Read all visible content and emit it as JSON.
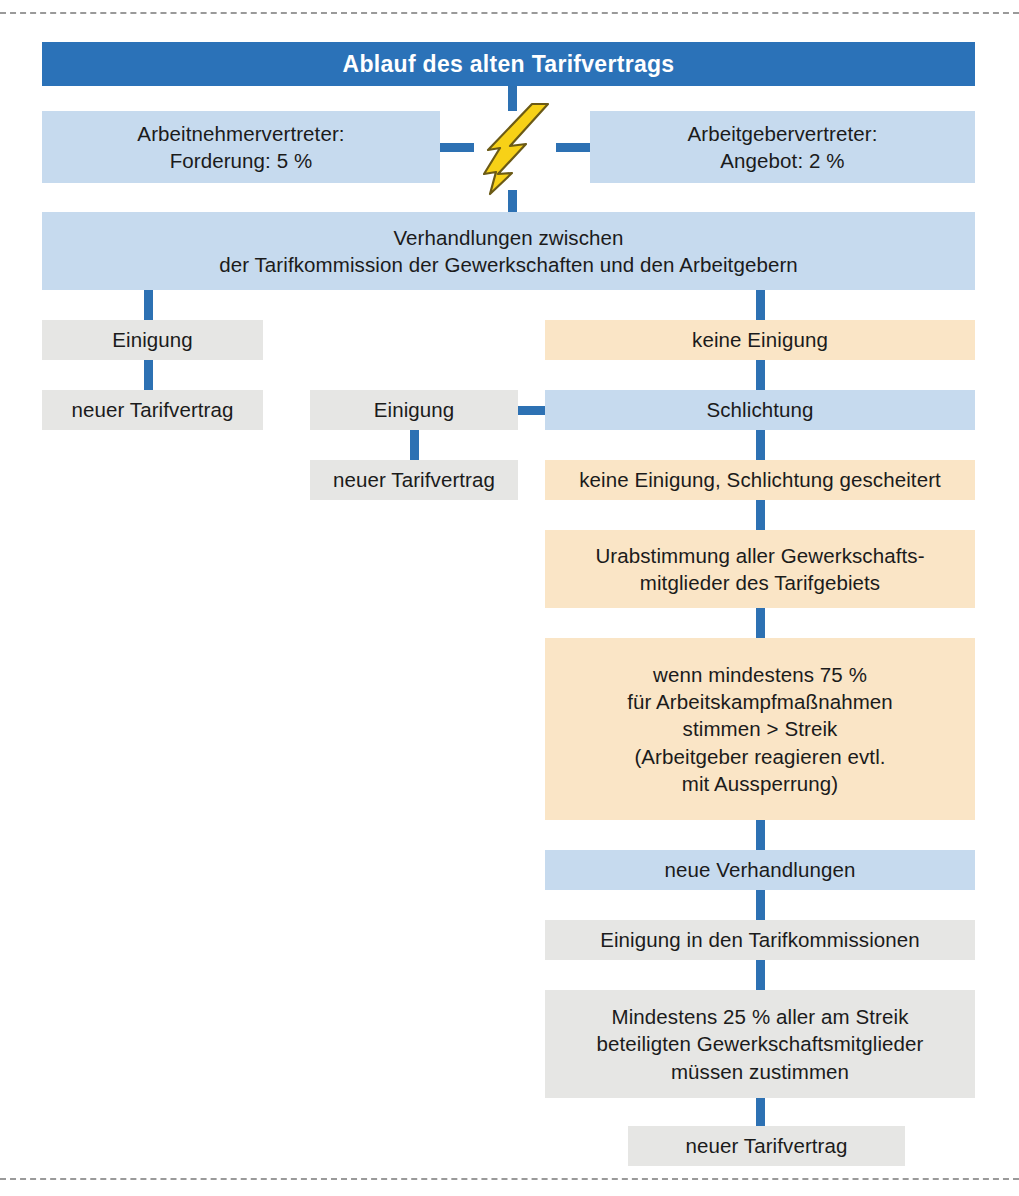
{
  "diagram": {
    "title": "Ablauf des alten Tarifvertrags",
    "language": "de",
    "colors": {
      "header_blue": "#2b72b8",
      "light_blue": "#c6daee",
      "peach": "#fae5c6",
      "gray": "#e6e6e4",
      "connector_blue": "#2d71b3",
      "bolt_yellow": "#f7d117",
      "bolt_outline": "#6b5a16",
      "dashed_rule": "#9a9a9a",
      "text_dark": "#1b1b1b",
      "text_light": "#ffffff"
    },
    "nodes": {
      "header": "Ablauf des alten Tarifvertrags",
      "employee_side": "Arbeitnehmervertreter:\nForderung: 5 %",
      "employer_side": "Arbeitgebervertreter:\nAngebot: 2 %",
      "negotiations": "Verhandlungen zwischen\nder Tarifkommission der Gewerkschaften und den Arbeitgebern",
      "agreement_left": "Einigung",
      "new_contract_left": "neuer Tarifvertrag",
      "no_agreement": "keine Einigung",
      "agreement_middle": "Einigung",
      "new_contract_middle": "neuer Tarifvertrag",
      "arbitration": "Schlichtung",
      "arbitration_failed": "keine Einigung, Schlichtung gescheitert",
      "ballot": "Urabstimmung aller Gewerkschafts-\nmitglieder des Tarifgebiets",
      "strike_threshold": "wenn mindestens 75 %\nfür Arbeitskampfmaßnahmen\nstimmen > Streik\n(Arbeitgeber reagieren evtl.\nmit Aussperrung)",
      "new_negotiations": "neue Verhandlungen",
      "commission_agreement": "Einigung in den Tarifkommissionen",
      "ratification": "Mindestens 25 % aller am Streik\nbeteiligten Gewerkschaftsmitglieder\nmüssen zustimmen",
      "new_contract_final": "neuer Tarifvertrag"
    },
    "icons": {
      "conflict_bolt": "lightning-bolt-icon"
    },
    "values": {
      "union_demand_percent": "5 %",
      "employer_offer_percent": "2 %",
      "strike_vote_threshold_percent": "75 %",
      "ratification_threshold_percent": "25 %"
    }
  }
}
